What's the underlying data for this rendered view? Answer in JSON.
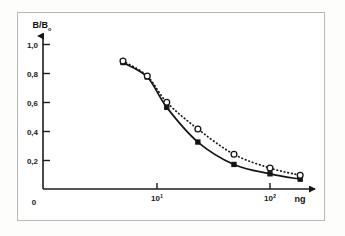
{
  "figure": {
    "frame_label": "scan-frame",
    "background_color": "#ffffff",
    "ink_color": "#151515",
    "frame_color": "#b9b9b4"
  },
  "axes": {
    "y_title": "B/B",
    "y_title_sub": "o",
    "y_arrow": "up-arrow",
    "x_unit_label": "ng",
    "x_arrow": "right-arrow",
    "origin_label": "0",
    "y_ticks": [
      "1,0",
      "0,8",
      "0,6",
      "0,4",
      "0,2"
    ],
    "x_tick_mantissa": [
      "10",
      "10"
    ],
    "x_tick_exponent": [
      "1",
      "2"
    ]
  },
  "chart_data": {
    "type": "line",
    "title": "",
    "subtitle": "",
    "xlabel": "ng",
    "ylabel": "B/B0",
    "xscale": "log",
    "xlim": [
      2.2,
      260
    ],
    "ylim": [
      0,
      1.12
    ],
    "grid": false,
    "legend": "none",
    "y_ticks": [
      0,
      0.2,
      0.4,
      0.6,
      0.8,
      1.0
    ],
    "y_tick_labels": [
      "0",
      "0,2",
      "0,4",
      "0,6",
      "0,8",
      "1,0"
    ],
    "x_ticks": [
      10,
      100
    ],
    "x_tick_labels": [
      "10^1",
      "10^2"
    ],
    "series": [
      {
        "name": "solid-curve",
        "style": "solid",
        "marker": "filled",
        "x": [
          5.0,
          8.2,
          12.2,
          23.0,
          48.0,
          100.0,
          185.0
        ],
        "y": [
          0.875,
          0.775,
          0.565,
          0.325,
          0.17,
          0.105,
          0.068
        ]
      },
      {
        "name": "dotted-curve",
        "style": "dotted",
        "marker": "open-circle",
        "x": [
          5.0,
          8.2,
          12.2,
          23.0,
          48.0,
          100.0,
          185.0
        ],
        "y": [
          0.885,
          0.782,
          0.6,
          0.415,
          0.24,
          0.145,
          0.095
        ]
      }
    ]
  }
}
